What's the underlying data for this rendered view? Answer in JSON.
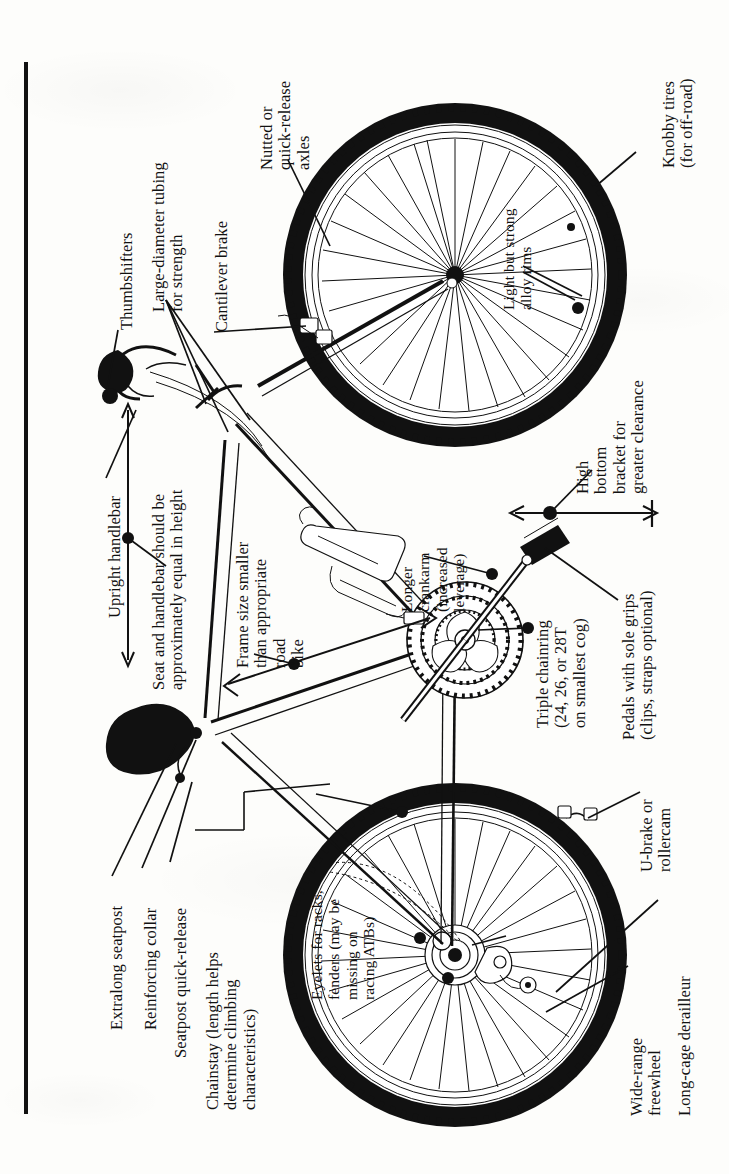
{
  "figure": {
    "orientation": "rotated-90-ccw",
    "ink_color": "#111111",
    "paper_color": "#fdfdfb"
  },
  "labels": {
    "thumbshifters": "Thumbshifters",
    "large_diameter_tubing": "Large-diameter tubing\nfor strength",
    "cantilever_brake": "Cantilever brake",
    "nutted_axles": "Nutted or\nquick-release\naxles",
    "knobby_tires": "Knobby tires\n(for off-road)",
    "alloy_rims": "Light but strong\nalloy rims",
    "upright_handlebar": "Upright handlebar",
    "seat_handlebar_height": "Seat and handlebar should be\napproximately equal in height",
    "frame_size": "Frame size smaller\nthan appropriate\nroad\nbike",
    "longer_crankarm": "Longer\ncrankarm\n(increased\nleverage)",
    "high_bottom_bracket": "High\nbottom\nbracket for\ngreater clearance",
    "triple_chainring": "Triple chainring\n(24, 26, or 28T\non smallest cog)",
    "pedals": "Pedals with sole grips\n(clips, straps optional)",
    "extralong_seatpost": "Extralong seatpost",
    "reinforcing_collar": "Reinforcing collar",
    "seatpost_quick_release": "Seatpost quick-release",
    "chainstay": "Chainstay (length helps\ndetermine climbing\ncharacteristics)",
    "eyelets": "Eyelets for racks,\nfenders (may be\nmissing on\nracing ATBs)",
    "u_brake": "U-brake or\nrollercam",
    "wide_range_freewheel": "Wide-range\nfreewheel",
    "long_cage_derailleur": "Long-cage derailleur"
  },
  "parts": [
    {
      "name": "front-wheel",
      "label_key": "knobby_tires"
    },
    {
      "name": "rear-wheel",
      "label_key": "wide_range_freewheel"
    },
    {
      "name": "handlebar",
      "label_key": "upright_handlebar"
    },
    {
      "name": "shifters",
      "label_key": "thumbshifters"
    },
    {
      "name": "frame-tubing",
      "label_key": "large_diameter_tubing"
    },
    {
      "name": "front-brake",
      "label_key": "cantilever_brake"
    },
    {
      "name": "hub-axle",
      "label_key": "nutted_axles"
    },
    {
      "name": "rim",
      "label_key": "alloy_rims"
    },
    {
      "name": "saddle",
      "label_key": "seat_handlebar_height"
    },
    {
      "name": "frame",
      "label_key": "frame_size"
    },
    {
      "name": "crankarm",
      "label_key": "longer_crankarm"
    },
    {
      "name": "bottom-bracket",
      "label_key": "high_bottom_bracket"
    },
    {
      "name": "chainring",
      "label_key": "triple_chainring"
    },
    {
      "name": "pedal",
      "label_key": "pedals"
    },
    {
      "name": "seatpost",
      "label_key": "extralong_seatpost"
    },
    {
      "name": "seat-collar",
      "label_key": "reinforcing_collar"
    },
    {
      "name": "seatpost-qr",
      "label_key": "seatpost_quick_release"
    },
    {
      "name": "chainstay",
      "label_key": "chainstay"
    },
    {
      "name": "dropout-eyelets",
      "label_key": "eyelets"
    },
    {
      "name": "rear-brake",
      "label_key": "u_brake"
    },
    {
      "name": "rear-derailleur",
      "label_key": "long_cage_derailleur"
    },
    {
      "name": "water-bottle-cage",
      "label_key": null
    }
  ]
}
